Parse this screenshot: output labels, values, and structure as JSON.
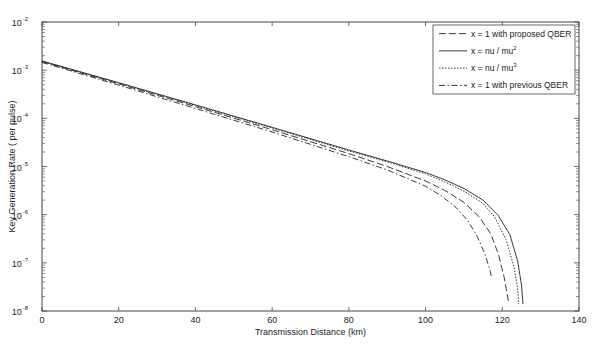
{
  "chart_data": {
    "type": "line",
    "title": "",
    "xlabel": "Transmission Distance (km)",
    "ylabel": "Key Generation Rate ( per pulse)",
    "xlim": [
      0,
      140
    ],
    "ylim": [
      1e-08,
      0.01
    ],
    "yscale": "log",
    "grid": false,
    "legend_position": "upper right",
    "x_ticks": [
      0,
      20,
      40,
      60,
      80,
      100,
      120,
      140
    ],
    "y_ticks": [
      {
        "value": 1e-08,
        "base": "10",
        "exp": "-8"
      },
      {
        "value": 1e-07,
        "base": "10",
        "exp": "-7"
      },
      {
        "value": 1e-06,
        "base": "10",
        "exp": "-6"
      },
      {
        "value": 1e-05,
        "base": "10",
        "exp": "-5"
      },
      {
        "value": 0.0001,
        "base": "10",
        "exp": "-4"
      },
      {
        "value": 0.001,
        "base": "10",
        "exp": "-3"
      },
      {
        "value": 0.01,
        "base": "10",
        "exp": "-2"
      }
    ],
    "series": [
      {
        "name": "x = 1 with proposed QBER",
        "legend_base": "x = 1 with proposed QBER",
        "legend_sup": "",
        "style": "dashed",
        "dash": "7,3",
        "x": [
          0,
          20,
          40,
          60,
          80,
          90,
          100,
          105,
          110,
          114,
          117,
          119,
          120.5,
          121.3,
          121.7
        ],
        "y": [
          0.0015,
          0.00052,
          0.000175,
          5.8e-05,
          1.85e-05,
          1e-05,
          5e-06,
          3.2e-06,
          1.8e-06,
          9e-07,
          4e-07,
          1.5e-07,
          5e-08,
          2.2e-08,
          1.4e-08
        ]
      },
      {
        "name": "x = nu / mu^2",
        "legend_base": "x = nu / mu",
        "legend_sup": "2",
        "style": "solid",
        "dash": "",
        "x": [
          0,
          20,
          40,
          60,
          80,
          90,
          100,
          105,
          110,
          115,
          119,
          122,
          124,
          125,
          125.4
        ],
        "y": [
          0.00155,
          0.00055,
          0.00019,
          6.5e-05,
          2.2e-05,
          1.3e-05,
          7.5e-06,
          5.3e-06,
          3.5e-06,
          2e-06,
          9.5e-07,
          3.8e-07,
          1.1e-07,
          3.5e-08,
          1.4e-08
        ]
      },
      {
        "name": "x = nu / mu^3",
        "legend_base": "x = nu / mu",
        "legend_sup": "3",
        "style": "dotted",
        "dash": "1.5,1.5",
        "x": [
          0,
          20,
          40,
          60,
          80,
          90,
          100,
          105,
          110,
          115,
          118,
          121,
          123,
          124,
          124.3
        ],
        "y": [
          0.00155,
          0.00054,
          0.000185,
          6.3e-05,
          2.1e-05,
          1.25e-05,
          7e-06,
          4.8e-06,
          3.1e-06,
          1.7e-06,
          9e-07,
          3e-07,
          8.5e-08,
          3e-08,
          1.4e-08
        ]
      },
      {
        "name": "x = 1 with previous QBER",
        "legend_base": "x = 1 with previous QBER",
        "legend_sup": "",
        "style": "dashdot",
        "dash": "6,2.5,1.5,2.5",
        "x": [
          0,
          20,
          40,
          60,
          80,
          90,
          100,
          104,
          108,
          111,
          113.5,
          115.5,
          116.8,
          117.2
        ],
        "y": [
          0.00145,
          0.00049,
          0.00016,
          5.2e-05,
          1.6e-05,
          8.5e-06,
          3.9e-06,
          2.5e-06,
          1.4e-06,
          7.5e-07,
          3.5e-07,
          1.5e-07,
          7e-08,
          5e-08
        ]
      }
    ]
  },
  "layout": {
    "plot": {
      "left": 42,
      "top": 22,
      "right": 579,
      "bottom": 311
    },
    "legend": {
      "left": 433,
      "top": 25,
      "right": 575,
      "bottom": 94
    },
    "colors": {
      "line": "#222222",
      "axis": "#444444",
      "background": "#ffffff"
    }
  }
}
